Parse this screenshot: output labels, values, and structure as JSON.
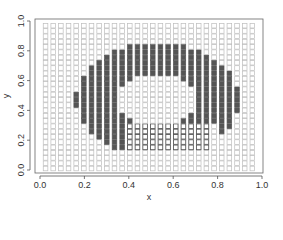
{
  "chart_data": {
    "type": "scatter",
    "title": "",
    "xlabel": "x",
    "ylabel": "y",
    "xlim": [
      0.0,
      1.0
    ],
    "ylim": [
      0.0,
      1.0
    ],
    "x_ticks": [
      "0.0",
      "0.2",
      "0.4",
      "0.6",
      "0.8",
      "1.0"
    ],
    "y_ticks": [
      "0.0",
      "0.2",
      "0.4",
      "0.6",
      "0.8",
      "1.0"
    ],
    "grid": false,
    "legend": null,
    "marker": "square",
    "grid_points": {
      "x_start": 0.025,
      "x_step": 0.0345,
      "x_count": 28,
      "y_start": 0.01,
      "y_step": 0.0355,
      "y_count": 28
    },
    "point_classes": [
      {
        "name": "background",
        "style": "light-gray outline square",
        "color": "#bdbdbd"
      },
      {
        "name": "class-1",
        "style": "dark filled square",
        "color": "#555555"
      },
      {
        "name": "class-2",
        "style": "dark outline square",
        "color": "#5a5a5a"
      }
    ],
    "regions": {
      "class-1_arc": {
        "description": "C-shaped arc of filled squares",
        "center": [
          0.53,
          0.47
        ],
        "outer_radius_x": 0.37,
        "outer_radius_y": 0.38,
        "inner_radius_x": 0.18,
        "inner_radius_y": 0.17,
        "excluded_gap": "lower-right sector below y≈0.3 between x≈0.4 and x≈0.8"
      },
      "class-2_block": {
        "description": "block of dark-outlined squares below the arc",
        "x_range": [
          0.38,
          0.78
        ],
        "y_range": [
          0.14,
          0.3
        ]
      }
    }
  },
  "axes": {
    "x_title": "x",
    "y_title": "y"
  }
}
